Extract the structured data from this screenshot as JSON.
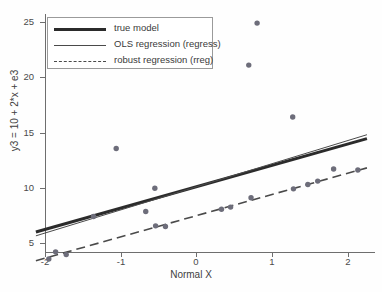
{
  "chart_data": {
    "type": "scatter",
    "title": "",
    "xlabel": "Normal X",
    "ylabel": "y3 = 10 + 2*x + e3",
    "xlim": [
      -2.12,
      2.25
    ],
    "ylim": [
      3.0,
      25.8
    ],
    "xticks": [
      -2,
      -1,
      0,
      1,
      2
    ],
    "yticks": [
      5,
      10,
      15,
      20,
      25
    ],
    "grid": false,
    "legend_position": "top-left",
    "legend": [
      {
        "label": "true model",
        "style": "thick-solid",
        "color": "#2b2b2b"
      },
      {
        "label": "OLS regression (regress)",
        "style": "thin-solid",
        "color": "#4a4a4a"
      },
      {
        "label": "robust regression (rreg)",
        "style": "dashed",
        "color": "#4a4a4a"
      }
    ],
    "series": [
      {
        "name": "observations",
        "type": "scatter",
        "marker": "filled-circle",
        "color": "#6d6d7a",
        "points": [
          {
            "x": -1.95,
            "y": 3.55
          },
          {
            "x": -1.86,
            "y": 4.2
          },
          {
            "x": -1.72,
            "y": 3.95
          },
          {
            "x": -1.36,
            "y": 7.4
          },
          {
            "x": -1.06,
            "y": 13.55
          },
          {
            "x": -0.67,
            "y": 7.85
          },
          {
            "x": -0.55,
            "y": 9.95
          },
          {
            "x": -0.54,
            "y": 6.55
          },
          {
            "x": -0.41,
            "y": 6.5
          },
          {
            "x": 0.33,
            "y": 8.05
          },
          {
            "x": 0.45,
            "y": 8.25
          },
          {
            "x": 0.69,
            "y": 21.1
          },
          {
            "x": 0.72,
            "y": 9.1
          },
          {
            "x": 0.8,
            "y": 24.9
          },
          {
            "x": 1.27,
            "y": 16.4
          },
          {
            "x": 1.28,
            "y": 9.9
          },
          {
            "x": 1.47,
            "y": 10.3
          },
          {
            "x": 1.6,
            "y": 10.6
          },
          {
            "x": 1.81,
            "y": 11.7
          },
          {
            "x": 2.13,
            "y": 11.6
          }
        ]
      },
      {
        "name": "true model",
        "type": "line",
        "style": "thick-solid",
        "color": "#2b2b2b",
        "endpoints": [
          {
            "x": -2.12,
            "y": 6.0
          },
          {
            "x": 2.25,
            "y": 14.45
          }
        ],
        "intercept": 10.1,
        "slope": 1.93
      },
      {
        "name": "OLS regression (regress)",
        "type": "line",
        "style": "thin-solid",
        "color": "#4a4a4a",
        "endpoints": [
          {
            "x": -2.12,
            "y": 5.65
          },
          {
            "x": 2.25,
            "y": 14.8
          }
        ],
        "intercept": 10.2,
        "slope": 2.09
      },
      {
        "name": "robust regression (rreg)",
        "type": "line",
        "style": "dashed",
        "color": "#4a4a4a",
        "endpoints": [
          {
            "x": -2.12,
            "y": 3.4
          },
          {
            "x": 2.25,
            "y": 11.8
          }
        ],
        "intercept": 7.47,
        "slope": 1.92
      }
    ]
  }
}
